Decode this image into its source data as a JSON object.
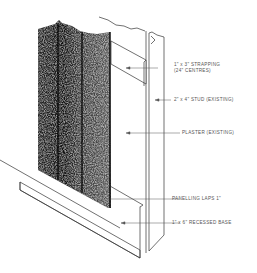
{
  "diagram": {
    "type": "construction-detail",
    "labels": [
      {
        "id": "strapping",
        "line1": "1\" x 3\" STRAPPING",
        "line2": "(24\" CENTRES)"
      },
      {
        "id": "stud",
        "line1": "2\" x 4\" STUD (EXISTING)"
      },
      {
        "id": "plaster",
        "line1": "PLASTER (EXISTING)"
      },
      {
        "id": "panelling",
        "line1": "PANELLING LAPS 1\""
      },
      {
        "id": "base",
        "line1": "1\" x 6\" RECESSED BASE"
      }
    ],
    "colors": {
      "line": "#333333",
      "text": "#555555",
      "panel": "#1a1a1a",
      "background": "#ffffff"
    }
  }
}
